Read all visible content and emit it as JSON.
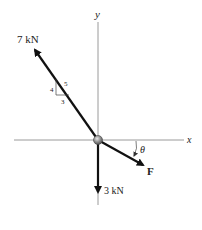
{
  "diagram": {
    "axes": {
      "x_label": "x",
      "y_label": "y"
    },
    "forces": [
      {
        "id": "force-7kn",
        "label": "7 kN",
        "direction": "up-left",
        "slope_triangle": {
          "rise": "4",
          "run": "3",
          "hyp": "5"
        }
      },
      {
        "id": "force-3kn",
        "label": "3 kN",
        "direction": "down"
      },
      {
        "id": "force-F",
        "label": "F",
        "direction": "down-right",
        "angle_label": "θ"
      }
    ],
    "origin_marker": "particle"
  }
}
